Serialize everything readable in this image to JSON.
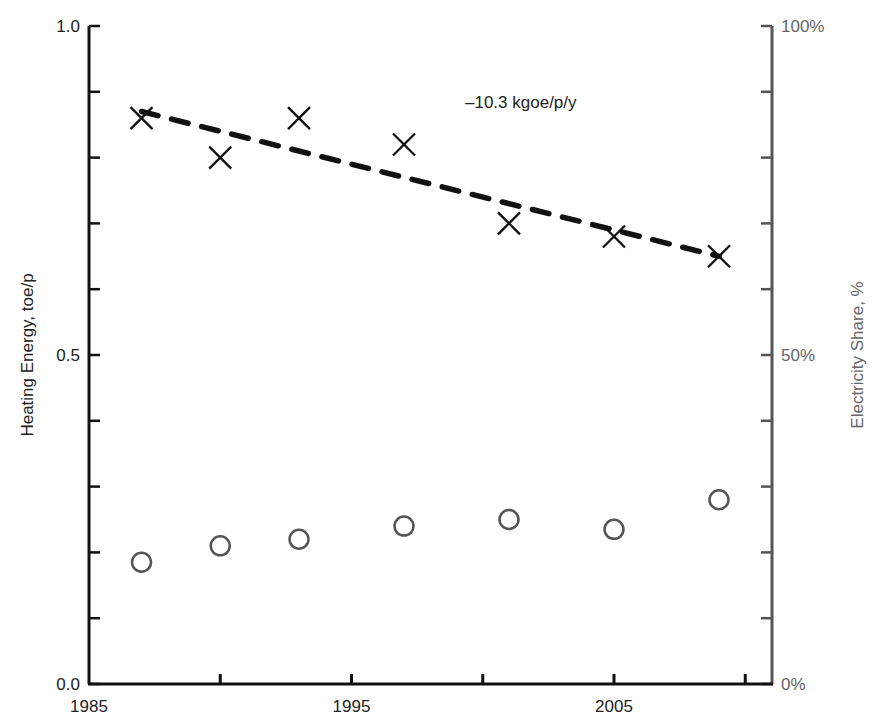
{
  "chart_data": {
    "type": "scatter",
    "title": "",
    "xlabel": "",
    "ylabel": "Heating Energy, toe/p",
    "y2label": "Electricity Share, %",
    "xlim": [
      1985,
      2012
    ],
    "ylim": [
      0.0,
      1.0
    ],
    "y2lim": [
      0,
      100
    ],
    "x_ticks": [
      1985,
      1990,
      1995,
      2000,
      2005,
      2010
    ],
    "x_tick_labels": [
      "1985",
      "",
      "1995",
      "",
      "2005",
      ""
    ],
    "y_ticks": [
      0.0,
      0.1,
      0.2,
      0.3,
      0.4,
      0.5,
      0.6,
      0.7,
      0.8,
      0.9,
      1.0
    ],
    "y_tick_labels": [
      "0.0",
      "",
      "",
      "",
      "",
      "0.5",
      "",
      "",
      "",
      "",
      "1.0"
    ],
    "y2_ticks": [
      0,
      10,
      20,
      30,
      40,
      50,
      60,
      70,
      80,
      90,
      100
    ],
    "y2_tick_labels": [
      "0%",
      "",
      "",
      "",
      "",
      "50%",
      "",
      "",
      "",
      "",
      "100%"
    ],
    "grid": false,
    "legend": null,
    "series": [
      {
        "name": "Heating Energy",
        "axis": "left",
        "marker": "x",
        "color": "#111111",
        "x": [
          1987,
          1990,
          1993,
          1997,
          2001,
          2005,
          2009
        ],
        "values": [
          0.86,
          0.8,
          0.86,
          0.82,
          0.7,
          0.68,
          0.65
        ]
      },
      {
        "name": "Electricity Share",
        "axis": "right",
        "marker": "circle-open",
        "color": "#555555",
        "x": [
          1987,
          1990,
          1993,
          1997,
          2001,
          2005,
          2009
        ],
        "values": [
          18.5,
          21,
          22,
          24,
          25,
          23.5,
          28
        ]
      },
      {
        "name": "Heating Energy trend",
        "axis": "left",
        "style": "dashed",
        "color": "#111111",
        "x": [
          1987,
          2009
        ],
        "values": [
          0.87,
          0.65
        ]
      }
    ],
    "annotations": [
      {
        "text": "–10.3 kgoe/p/y",
        "x": 1995.3,
        "y": 0.88
      }
    ]
  }
}
